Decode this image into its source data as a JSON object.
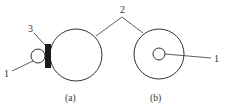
{
  "figure": {
    "subfigures": [
      {
        "id": "a",
        "caption": "(a)",
        "labels": [
          {
            "text": "3",
            "target": "black-rectangular-block"
          },
          {
            "text": "1",
            "target": "small-circle"
          }
        ]
      },
      {
        "id": "b",
        "caption": "(b)",
        "labels": [
          {
            "text": "1",
            "target": "inner-small-circle"
          }
        ]
      }
    ],
    "shared_label": {
      "text": "2",
      "target": "large-circles"
    },
    "colors": {
      "stroke": "#333333",
      "fill_block": "#1a1a1a",
      "background": "#ffffff"
    }
  }
}
